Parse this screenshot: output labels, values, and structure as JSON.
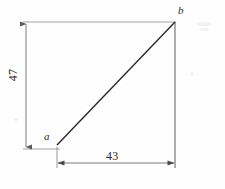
{
  "figure": {
    "vertices": [
      {
        "name": "a",
        "label": "a",
        "x": 57,
        "y": 145,
        "role": "bottom-left-vertex"
      },
      {
        "name": "b",
        "label": "b",
        "x": 175,
        "y": 22,
        "role": "top-right-vertex"
      }
    ],
    "dimensions": [
      {
        "name": "vertical-leg",
        "value": "47",
        "orientation": "vertical",
        "rotation_deg": -90,
        "from": "a",
        "to": "top"
      },
      {
        "name": "horizontal-leg",
        "value": "43",
        "orientation": "horizontal",
        "rotation_deg": 0,
        "from": "a",
        "to": "b-base"
      }
    ],
    "colors": {
      "hypotenuse": "#2b2b2b",
      "dimension_line": "#6e6e6e",
      "extension_line": "#8c8c8c",
      "background": "#fefefe",
      "text": "#2a2a2a"
    }
  }
}
